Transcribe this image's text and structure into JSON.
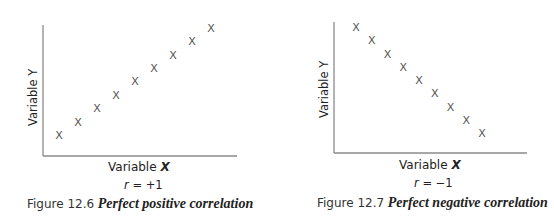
{
  "chart_data": [
    {
      "type": "scatter",
      "title": "Perfect positive correlation",
      "figure_label": "Figure 12.6",
      "xlabel": "Variable X",
      "ylabel": "Variable Y",
      "annotation": "r = +1",
      "r": "+1",
      "marker": "X",
      "grid": false,
      "legend": null,
      "x": [
        1,
        2,
        3,
        4,
        5,
        6,
        7,
        8,
        9
      ],
      "y": [
        1,
        2,
        3,
        4,
        5,
        6,
        7,
        8,
        9
      ]
    },
    {
      "type": "scatter",
      "title": "Perfect negative correlation",
      "figure_label": "Figure 12.7",
      "xlabel": "Variable X",
      "ylabel": "Variable Y",
      "annotation": "r = −1",
      "r": "−1",
      "marker": "X",
      "grid": false,
      "legend": null,
      "x": [
        1,
        2,
        3,
        4,
        5,
        6,
        7,
        8,
        9
      ],
      "y": [
        9,
        8,
        7,
        6,
        5,
        4,
        3,
        2,
        1
      ]
    }
  ],
  "figures": [
    {
      "figure_label": "Figure 12.6",
      "title": "Perfect positive correlation",
      "xlabel_prefix": "Variable",
      "xlabel_var": "X",
      "ylabel": "Variable Y",
      "r_symbol": "r",
      "r_text": " = +1",
      "marker_glyph": "X"
    },
    {
      "figure_label": "Figure 12.7",
      "title": "Perfect negative correlation",
      "xlabel_prefix": "Variable",
      "xlabel_var": "X",
      "ylabel": "Variable Y",
      "r_symbol": "r",
      "r_text": " = −1",
      "marker_glyph": "X"
    }
  ],
  "colors": {
    "axis": "#8a8a8a",
    "marker": "#555555",
    "text": "#222222",
    "background": "#ffffff"
  }
}
